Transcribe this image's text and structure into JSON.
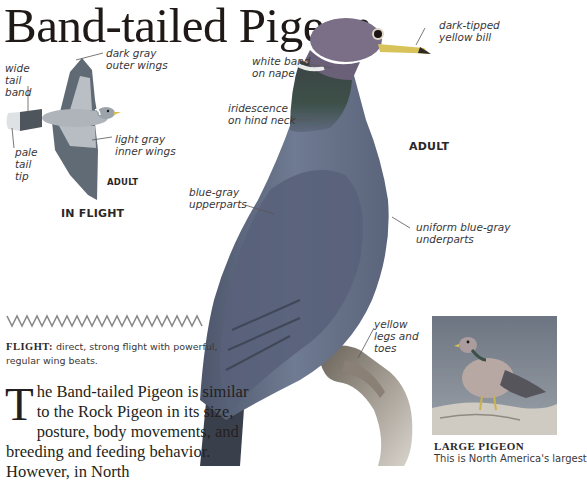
{
  "page": {
    "title": "Band-tailed Pigeon"
  },
  "flight_illustration": {
    "labels": {
      "wide_tail_band": "wide\ntail\nband",
      "dark_gray_outer_wings": "dark gray\nouter wings",
      "pale_tail_tip": "pale\ntail\ntip",
      "light_gray_inner_wings": "light gray\ninner wings"
    },
    "age_caption": "ADULT",
    "view_caption": "IN FLIGHT"
  },
  "main_illustration": {
    "labels": {
      "white_band_on_nape": "white band\non nape",
      "dark_tipped_yellow_bill": "dark-tipped\nyellow bill",
      "iridescence_on_hind_neck": "iridescence\non hind neck",
      "blue_gray_upperparts": "blue-gray\nupperparts",
      "uniform_blue_gray_underparts": "uniform blue-gray\nunderparts",
      "yellow_legs_and_toes": "yellow\nlegs and\ntoes"
    },
    "age_caption": "ADULT"
  },
  "flight_pattern": {
    "icon": "zigzag-flight-path-icon",
    "label": "FLIGHT:",
    "description": "direct, strong flight with powerful, regular wing beats."
  },
  "body_text": {
    "drop_cap": "T",
    "text": "he Band-tailed Pigeon is similar to the Rock Pigeon in its size, posture, body movements, and breeding and feeding behavior. However, in North"
  },
  "photo_inset": {
    "title": "LARGE PIGEON",
    "text": "This is North America's largest"
  },
  "colors": {
    "text": "#231f20",
    "label_text": "#3a3637",
    "leader_line": "#5a5657",
    "zigzag": "#8a8889",
    "bird_body": "#6e7a90",
    "bird_head": "#7a6f86",
    "photo_background": "#7f8894"
  }
}
